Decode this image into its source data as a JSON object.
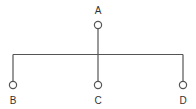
{
  "diagram": {
    "type": "tree",
    "line_color": "#555555",
    "node_fill": "#ffffff",
    "root": {
      "id": "A",
      "label": "A"
    },
    "children": [
      {
        "id": "B",
        "label": "B"
      },
      {
        "id": "C",
        "label": "C"
      },
      {
        "id": "D",
        "label": "D"
      }
    ],
    "edges": [
      {
        "from": "A",
        "to": "B"
      },
      {
        "from": "A",
        "to": "C"
      },
      {
        "from": "A",
        "to": "D"
      }
    ]
  }
}
